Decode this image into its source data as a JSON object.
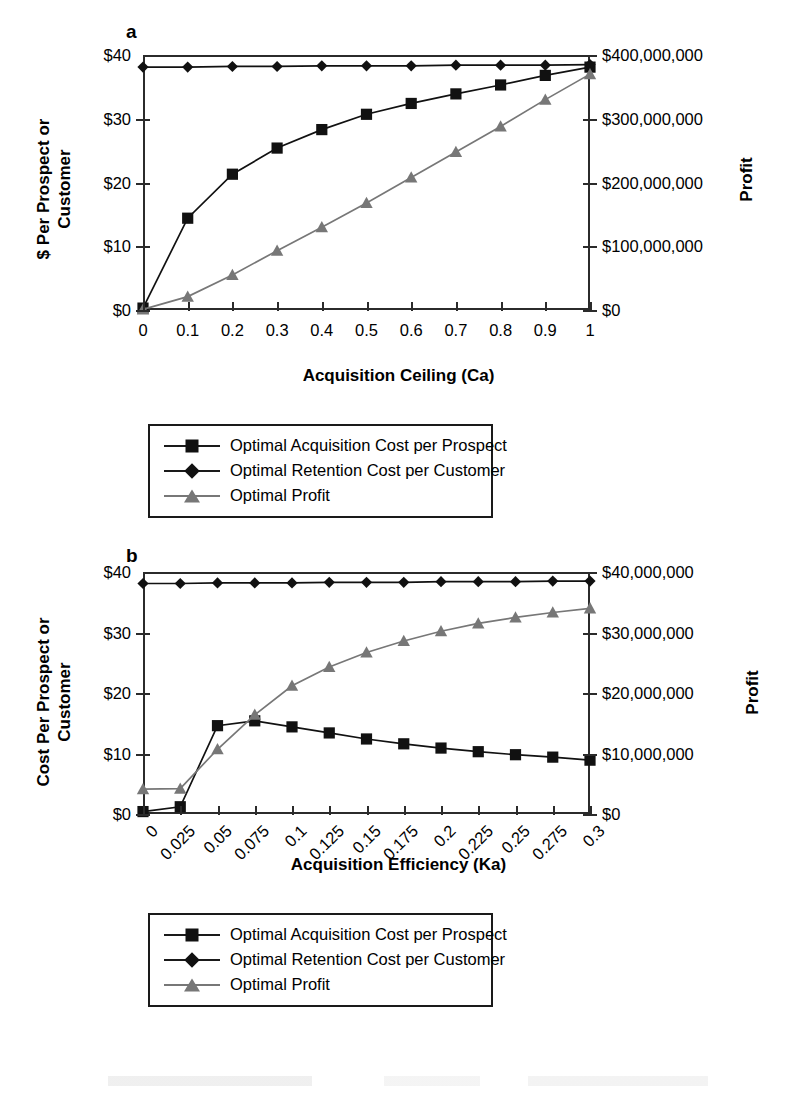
{
  "figure": {
    "panel_a_letter": "a",
    "panel_b_letter": "b"
  },
  "legend_entries": [
    {
      "label": "Optimal Acquisition Cost per Prospect",
      "marker": "square-marker",
      "color": "#111111"
    },
    {
      "label": "Optimal Retention Cost per Customer",
      "marker": "diamond-marker",
      "color": "#111111"
    },
    {
      "label": "Optimal Profit",
      "marker": "triangle-marker",
      "color": "#777777"
    }
  ],
  "chart_data": [
    {
      "id": "panel-a",
      "panel": "a",
      "type": "line",
      "title": "",
      "xlabel": "Acquisition Ceiling (Ca)",
      "ylabel": "$ Per Prospect or\nCustomer",
      "y2label": "Profit",
      "x": [
        0,
        0.1,
        0.2,
        0.3,
        0.4,
        0.5,
        0.6,
        0.7,
        0.8,
        0.9,
        1
      ],
      "xticklabels": [
        "0",
        "0.1",
        "0.2",
        "0.3",
        "0.4",
        "0.5",
        "0.6",
        "0.7",
        "0.8",
        "0.9",
        "1"
      ],
      "xlim": [
        0,
        1
      ],
      "ylim": [
        0,
        40
      ],
      "yticks": [
        0,
        10,
        20,
        30,
        40
      ],
      "yticklabels": [
        "$0",
        "$10",
        "$20",
        "$30",
        "$40"
      ],
      "y2lim": [
        0,
        400000000
      ],
      "y2ticks": [
        0,
        100000000,
        200000000,
        300000000,
        400000000
      ],
      "y2ticklabels": [
        "$0",
        "$100,000,000",
        "$200,000,000",
        "$300,000,000",
        "$400,000,000"
      ],
      "grid": false,
      "legend_position": "below",
      "series": [
        {
          "name": "Optimal Acquisition Cost per Prospect",
          "axis": "left",
          "marker": "square-marker",
          "color": "#111111",
          "values": [
            0.3,
            14.4,
            21.3,
            25.4,
            28.3,
            30.7,
            32.4,
            33.9,
            35.3,
            36.8,
            38.1
          ]
        },
        {
          "name": "Optimal Retention Cost per Customer",
          "axis": "left",
          "marker": "diamond-marker",
          "color": "#111111",
          "values": [
            38.1,
            38.1,
            38.2,
            38.2,
            38.3,
            38.3,
            38.3,
            38.4,
            38.4,
            38.4,
            38.5
          ]
        },
        {
          "name": "Optimal Profit",
          "axis": "right",
          "marker": "triangle-marker",
          "color": "#777777",
          "values": [
            1000000,
            21000000,
            55000000,
            93000000,
            130000000,
            168000000,
            208000000,
            248000000,
            288000000,
            330000000,
            370000000
          ]
        }
      ]
    },
    {
      "id": "panel-b",
      "panel": "b",
      "type": "line",
      "title": "",
      "xlabel": "Acquisition Efficiency (Ka)",
      "ylabel": "Cost Per Prospect or\nCustomer",
      "y2label": "Profit",
      "x": [
        0,
        0.025,
        0.05,
        0.075,
        0.1,
        0.125,
        0.15,
        0.175,
        0.2,
        0.225,
        0.25,
        0.275,
        0.3
      ],
      "xticklabels": [
        "0",
        "0.025",
        "0.05",
        "0.075",
        "0.1",
        "0.125",
        "0.15",
        "0.175",
        "0.2",
        "0.225",
        "0.25",
        "0.275",
        "0.3"
      ],
      "xlim": [
        0,
        0.3
      ],
      "ylim": [
        0,
        40
      ],
      "yticks": [
        0,
        10,
        20,
        30,
        40
      ],
      "yticklabels": [
        "$0",
        "$10",
        "$20",
        "$30",
        "$40"
      ],
      "y2lim": [
        0,
        40000000
      ],
      "y2ticks": [
        0,
        10000000,
        20000000,
        30000000,
        40000000
      ],
      "y2ticklabels": [
        "$0",
        "$10,000,000",
        "$20,000,000",
        "$30,000,000",
        "$40,000,000"
      ],
      "grid": false,
      "legend_position": "below",
      "series": [
        {
          "name": "Optimal Acquisition Cost per Prospect",
          "axis": "left",
          "marker": "square-marker",
          "color": "#111111",
          "values": [
            0.4,
            1.2,
            14.6,
            15.4,
            14.4,
            13.4,
            12.4,
            11.6,
            10.9,
            10.3,
            9.8,
            9.4,
            8.9
          ]
        },
        {
          "name": "Optimal Retention Cost per Customer",
          "axis": "left",
          "marker": "diamond-marker",
          "color": "#111111",
          "values": [
            38.1,
            38.1,
            38.2,
            38.2,
            38.2,
            38.3,
            38.3,
            38.3,
            38.4,
            38.4,
            38.4,
            38.5,
            38.5
          ]
        },
        {
          "name": "Optimal Profit",
          "axis": "right",
          "marker": "triangle-marker",
          "color": "#777777",
          "values": [
            4100000,
            4200000,
            10700000,
            16400000,
            21200000,
            24300000,
            26700000,
            28600000,
            30200000,
            31500000,
            32500000,
            33300000,
            34000000
          ]
        }
      ]
    }
  ]
}
